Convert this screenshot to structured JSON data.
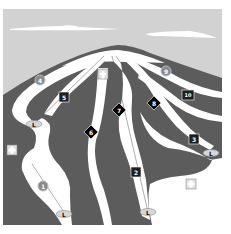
{
  "map": {
    "type": "ski-trail-map",
    "colors": {
      "sky": "#d2d2d2",
      "cloud": "#ffffff",
      "terrain": "#5c5c5c",
      "snow": "#ffffff",
      "green_marker": "#8a8a8a",
      "blue_marker": "#1e1e1e",
      "black_marker": "#000000",
      "lift_badge": "#d6d6d6",
      "first_aid": "#e0e0e0"
    },
    "trails": [
      {
        "id": "1",
        "label": "1",
        "difficulty": "circle",
        "x": 43,
        "y": 186
      },
      {
        "id": "2",
        "label": "2",
        "difficulty": "square",
        "x": 136,
        "y": 172
      },
      {
        "id": "3",
        "label": "3",
        "difficulty": "square",
        "x": 194,
        "y": 139
      },
      {
        "id": "4",
        "label": "4",
        "difficulty": "circle",
        "x": 40,
        "y": 80
      },
      {
        "id": "5",
        "label": "5",
        "difficulty": "square",
        "x": 64,
        "y": 97
      },
      {
        "id": "6",
        "label": "6",
        "difficulty": "diamond",
        "x": 91,
        "y": 132
      },
      {
        "id": "7",
        "label": "7",
        "difficulty": "diamond",
        "x": 119,
        "y": 110
      },
      {
        "id": "8",
        "label": "8",
        "difficulty": "diamond",
        "x": 154,
        "y": 103
      },
      {
        "id": "9",
        "label": "9",
        "difficulty": "circle",
        "x": 166,
        "y": 71
      },
      {
        "id": "10",
        "label": "10",
        "difficulty": "square",
        "x": 188,
        "y": 95
      }
    ],
    "lifts": [
      {
        "label": "L",
        "x": 34,
        "y": 124
      },
      {
        "label": "L",
        "x": 64,
        "y": 214
      },
      {
        "label": "L",
        "x": 148,
        "y": 212
      },
      {
        "label": "L",
        "x": 211,
        "y": 153
      }
    ],
    "first_aid": [
      {
        "x": 103,
        "y": 74
      },
      {
        "x": 12,
        "y": 150
      },
      {
        "x": 191,
        "y": 184
      }
    ]
  }
}
